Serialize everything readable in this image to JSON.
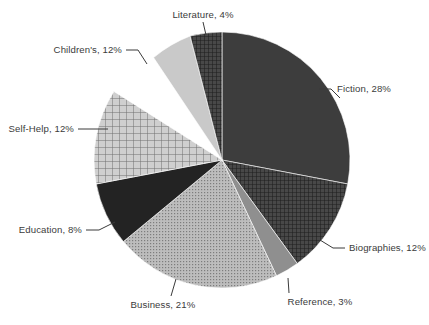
{
  "chart_data": {
    "type": "pie",
    "title": "",
    "subtitle": "",
    "xlabel": "",
    "ylabel": "",
    "legend_position": "none",
    "grid": false,
    "labels_show_percent": true,
    "start_angle_deg": 0,
    "direction": "clockwise",
    "categories": [
      "Fiction",
      "Biographies",
      "Reference",
      "Business",
      "Education",
      "Self-Help",
      "Children's",
      "Literature"
    ],
    "values": [
      28,
      12,
      3,
      21,
      8,
      12,
      12,
      4
    ],
    "slices": [
      {
        "name": "Fiction",
        "value": 28,
        "label": "Fiction, 28%",
        "color": "#3d3d3d",
        "pattern": "solid",
        "start_deg": 0,
        "end_deg": 100.8
      },
      {
        "name": "Biographies",
        "value": 12,
        "label": "Biographies, 12%",
        "color": "#424242",
        "pattern": "crosshatch-fine",
        "start_deg": 100.8,
        "end_deg": 144.0
      },
      {
        "name": "Reference",
        "value": 3,
        "label": "Reference, 3%",
        "color": "#8f8f8f",
        "pattern": "solid",
        "start_deg": 144.0,
        "end_deg": 154.8
      },
      {
        "name": "Business",
        "value": 21,
        "label": "Business, 21%",
        "color": "#a8a8a8",
        "pattern": "dotted-fine",
        "start_deg": 154.8,
        "end_deg": 230.4
      },
      {
        "name": "Education",
        "value": 8,
        "label": "Education, 8%",
        "color": "#232323",
        "pattern": "solid",
        "start_deg": 230.4,
        "end_deg": 259.2
      },
      {
        "name": "Self-Help",
        "value": 12,
        "label": "Self-Help, 12%",
        "color": "#b9b9b9",
        "pattern": "crosshatch-coarse",
        "start_deg": 259.2,
        "end_deg": 302.4
      },
      {
        "name": "Children's",
        "value": 12,
        "label": "Children's, 12%",
        "color": "#c9c9c9",
        "pattern": "solid",
        "start_deg": 302.4,
        "end_deg": 345.6
      },
      {
        "name": "Literature",
        "value": 4,
        "label": "Literature, 4%",
        "color": "#3f3f3f",
        "pattern": "crosshatch-fine",
        "start_deg": 345.6,
        "end_deg": 360.0
      }
    ],
    "label_text_color": "#3b3b3b",
    "background_color": "#ffffff",
    "center": {
      "x": 222,
      "y": 160
    },
    "radius": 128
  },
  "labels": {
    "literature": "Literature, 4%",
    "childrens": "Children's, 12%",
    "self_help": "Self-Help, 12%",
    "education": "Education, 8%",
    "business": "Business, 21%",
    "reference": "Reference, 3%",
    "biographies": "Biographies, 12%",
    "fiction": "Fiction, 28%"
  }
}
